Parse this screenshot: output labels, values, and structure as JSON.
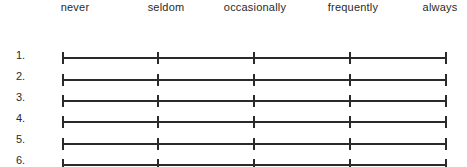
{
  "scale": {
    "labels": [
      "never",
      "seldom",
      "occasionally",
      "frequently",
      "always"
    ]
  },
  "items": [
    {
      "number": "1."
    },
    {
      "number": "2."
    },
    {
      "number": "3."
    },
    {
      "number": "4."
    },
    {
      "number": "5."
    },
    {
      "number": "6."
    }
  ]
}
